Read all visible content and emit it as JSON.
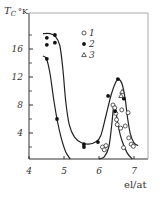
{
  "chart_data": {
    "type": "scatter",
    "title": "",
    "xlabel": "el/at",
    "ylabel": "T_C °K",
    "ylabel_main": "T",
    "ylabel_sub": "C",
    "ylabel_unit": "°K",
    "xlim": [
      4,
      7.3
    ],
    "ylim": [
      0,
      20
    ],
    "x_ticks": [
      4,
      5,
      6,
      7
    ],
    "x_tick_labels": [
      "4",
      "5",
      "6",
      "7"
    ],
    "y_ticks": [
      4,
      8,
      12,
      16
    ],
    "y_tick_labels": [
      "4",
      "8",
      "12",
      "16"
    ],
    "grid": false,
    "legend_position": "top-right",
    "series": [
      {
        "name": "1",
        "marker": "open-circle",
        "points": [
          [
            6.4,
            8.0
          ],
          [
            6.45,
            7.6
          ],
          [
            6.48,
            6.8
          ],
          [
            6.5,
            5.9
          ],
          [
            6.52,
            5.2
          ],
          [
            6.1,
            2.0
          ],
          [
            6.15,
            1.6
          ],
          [
            6.2,
            2.2
          ],
          [
            6.62,
            4.7
          ],
          [
            6.65,
            7.3
          ],
          [
            6.75,
            5.0
          ],
          [
            6.83,
            6.9
          ],
          [
            6.85,
            3.3
          ],
          [
            6.92,
            2.4
          ],
          [
            6.98,
            2.1
          ],
          [
            6.7,
            1.9
          ]
        ]
      },
      {
        "name": "2",
        "marker": "filled-circle",
        "points": [
          [
            4.51,
            17.6
          ],
          [
            4.51,
            16.6
          ],
          [
            4.74,
            18.0
          ],
          [
            4.74,
            16.9
          ],
          [
            4.51,
            14.6
          ],
          [
            4.8,
            6.0
          ],
          [
            5.57,
            2.0
          ],
          [
            5.57,
            2.4
          ],
          [
            5.97,
            2.7
          ],
          [
            6.26,
            9.3
          ],
          [
            6.54,
            11.7
          ],
          [
            6.46,
            7.1
          ],
          [
            6.71,
            8.9
          ]
        ]
      },
      {
        "name": "3",
        "marker": "open-triangle",
        "points": [
          [
            6.66,
            9.9
          ],
          [
            6.63,
            9.3
          ]
        ]
      }
    ],
    "curves": [
      {
        "name": "upper-envelope",
        "points": [
          [
            4.4,
            18.2
          ],
          [
            4.6,
            18.2
          ],
          [
            4.75,
            17.8
          ],
          [
            4.88,
            16.5
          ],
          [
            4.97,
            13
          ],
          [
            5.05,
            8.5
          ],
          [
            5.15,
            5.2
          ],
          [
            5.3,
            3.4
          ],
          [
            5.5,
            2.6
          ],
          [
            5.7,
            2.4
          ],
          [
            5.9,
            2.7
          ],
          [
            6.05,
            3.6
          ],
          [
            6.2,
            6.5
          ],
          [
            6.35,
            9.5
          ],
          [
            6.48,
            11.3
          ],
          [
            6.56,
            11.7
          ],
          [
            6.66,
            11.0
          ],
          [
            6.75,
            8.8
          ],
          [
            6.82,
            6.0
          ],
          [
            6.9,
            3.8
          ],
          [
            7.0,
            2.6
          ],
          [
            7.12,
            2.2
          ]
        ]
      },
      {
        "name": "left-branch",
        "points": [
          [
            4.4,
            15.0
          ],
          [
            4.5,
            14.6
          ],
          [
            4.6,
            12.5
          ],
          [
            4.7,
            9.0
          ],
          [
            4.8,
            6.0
          ],
          [
            4.92,
            3.3
          ],
          [
            5.05,
            1.3
          ],
          [
            5.18,
            0.0
          ]
        ]
      },
      {
        "name": "narrow-peak",
        "points": [
          [
            6.0,
            0.0
          ],
          [
            6.15,
            0.6
          ],
          [
            6.28,
            2.0
          ],
          [
            6.36,
            5.0
          ],
          [
            6.42,
            7.8
          ],
          [
            6.47,
            7.5
          ],
          [
            6.55,
            5.0
          ],
          [
            6.65,
            3.0
          ],
          [
            6.8,
            1.2
          ],
          [
            6.95,
            0.0
          ]
        ]
      }
    ]
  }
}
